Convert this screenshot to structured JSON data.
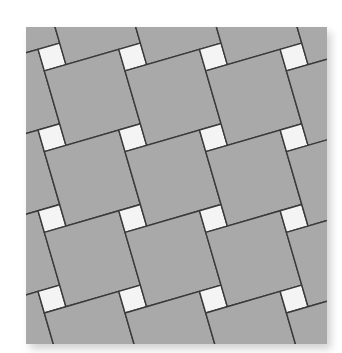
{
  "image": {
    "subject": "pinwheel tile pattern",
    "description": "Large gray square pavers with small white square insets arranged in a rotated pinwheel (basketweave) pattern"
  },
  "pattern": {
    "frame": {
      "left": 26,
      "top": 27,
      "width": 301,
      "height": 317
    },
    "large_tile_side": 77.5,
    "small_tile_side": 22.5,
    "origin_small_center": [
      52,
      57
    ],
    "colors": {
      "large_tile": "#a9a9a9",
      "small_tile": "#f4f4f4",
      "grout_line": "#3a3a3a",
      "background": "#ffffff"
    },
    "grout_width": 1.4
  }
}
